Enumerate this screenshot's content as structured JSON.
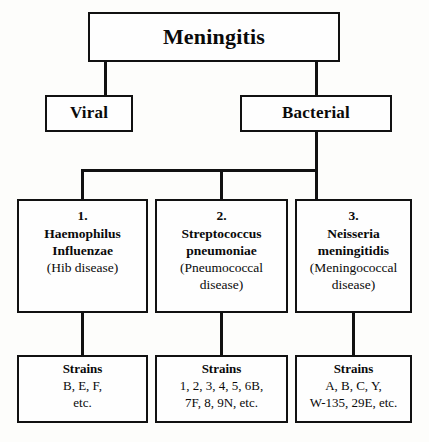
{
  "diagram": {
    "title": "Meningitis",
    "root": {
      "label": "Meningitis"
    },
    "level2": {
      "viral": "Viral",
      "bacterial": "Bacterial"
    },
    "pathogens": [
      {
        "number": "1.",
        "genus": "Haemophilus",
        "species": "Influenzae",
        "disease_line1": "(Hib disease)",
        "disease_line2": ""
      },
      {
        "number": "2.",
        "genus": "Streptococcus",
        "species": "pneumoniae",
        "disease_line1": "(Pneumococcal",
        "disease_line2": "disease)"
      },
      {
        "number": "3.",
        "genus": "Neisseria",
        "species": "meningitidis",
        "disease_line1": "(Meningococcal",
        "disease_line2": "disease)"
      }
    ],
    "strains": [
      {
        "heading": "Strains",
        "line1": "B, E, F,",
        "line2": "etc."
      },
      {
        "heading": "Strains",
        "line1": "1, 2, 3, 4, 5, 6B,",
        "line2": "7F, 8, 9N, etc."
      },
      {
        "heading": "Strains",
        "line1": "A, B, C, Y,",
        "line2": "W-135, 29E, etc."
      }
    ],
    "colors": {
      "background": "#fdfdfb",
      "box_fill": "#fefefe",
      "stroke": "#111111",
      "text": "#0a0a0a"
    }
  }
}
